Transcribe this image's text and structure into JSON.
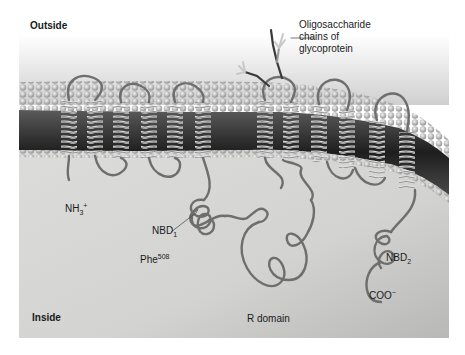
{
  "figure": {
    "regions": {
      "outside": "Outside",
      "inside": "Inside"
    },
    "labels": {
      "oligosaccharide_line1": "Oligosaccharide",
      "oligosaccharide_line2": "chains of",
      "oligosaccharide_line3": "glycoprotein",
      "n_terminus_base": "NH",
      "n_terminus_sub": "3",
      "n_terminus_sup": "+",
      "nbd1_base": "NBD",
      "nbd1_sub": "1",
      "phe_base": "Phe",
      "phe_sup": "508",
      "r_domain": "R domain",
      "nbd2_base": "NBD",
      "nbd2_sub": "2",
      "c_terminus_base": "COO",
      "c_terminus_sup": "−"
    },
    "colors": {
      "background_top": "#ffffff",
      "outside_fade": "#d9d9d9",
      "membrane_head": "#bdbdbd",
      "membrane_core": "#2b2b2b",
      "protein_strand": "#6e6e6e",
      "cytoplasm": "#d6d6d4"
    }
  }
}
